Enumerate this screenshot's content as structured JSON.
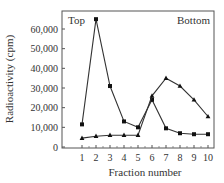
{
  "chart_data": {
    "type": "line",
    "title": "",
    "xlabel": "Fraction number",
    "ylabel": "Radioactivity (cpm)",
    "x": [
      1,
      2,
      3,
      4,
      5,
      6,
      7,
      8,
      9,
      10
    ],
    "xticks": [
      "1",
      "2",
      "3",
      "4",
      "5",
      "6",
      "7",
      "8",
      "9",
      "10"
    ],
    "yticks": [
      0,
      10000,
      20000,
      30000,
      40000,
      50000,
      60000
    ],
    "ytick_labels": [
      "0",
      "10,000",
      "20,000",
      "30,000",
      "40,000",
      "50,000",
      "60,000"
    ],
    "ylim": [
      0,
      69000
    ],
    "xlim": [
      0,
      10.4
    ],
    "grid": false,
    "legend": null,
    "annotations": [
      {
        "text": "Top",
        "position": "top-left"
      },
      {
        "text": "Bottom",
        "position": "top-right"
      }
    ],
    "series": [
      {
        "name": "squares",
        "marker": "square",
        "values": [
          11500,
          65000,
          31000,
          13000,
          10000,
          24000,
          9500,
          7000,
          6500,
          6500
        ]
      },
      {
        "name": "triangles",
        "marker": "triangle",
        "values": [
          4500,
          5500,
          6000,
          6000,
          6000,
          26000,
          35000,
          31000,
          24000,
          15500
        ]
      }
    ]
  }
}
